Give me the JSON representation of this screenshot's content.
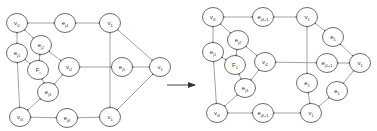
{
  "diagram": {
    "colors": {
      "stroke": "#5a5a5a",
      "edge": "#8a8a8a",
      "text": "#333333",
      "background": "#ffffff"
    },
    "arrow": {
      "x1": 167,
      "y1": 85,
      "x2": 195,
      "y2": 85
    },
    "left": {
      "nodes": [
        {
          "id": "L_vi1",
          "label": "v",
          "sub": "i1",
          "x": 17,
          "y": 23
        },
        {
          "id": "L_ej4",
          "label": "e",
          "sub": "j4",
          "x": 65,
          "y": 23
        },
        {
          "id": "L_v1_top",
          "label": "v",
          "sub": "1",
          "x": 110,
          "y": 23
        },
        {
          "id": "L_ej2",
          "label": "e",
          "sub": "j2",
          "x": 41,
          "y": 45
        },
        {
          "id": "L_ej1",
          "label": "e",
          "sub": "j1",
          "x": 17,
          "y": 53
        },
        {
          "id": "L_Fi",
          "label": "F",
          "sub": "i",
          "x": 38,
          "y": 70
        },
        {
          "id": "L_vi2",
          "label": "v",
          "sub": "i2",
          "x": 69,
          "y": 67
        },
        {
          "id": "L_ej5",
          "label": "e",
          "sub": "j5",
          "x": 122,
          "y": 67
        },
        {
          "id": "L_v1_right",
          "label": "v",
          "sub": "1",
          "x": 160,
          "y": 67
        },
        {
          "id": "L_ej3",
          "label": "e",
          "sub": "j3",
          "x": 48,
          "y": 92
        },
        {
          "id": "L_vi3",
          "label": "v",
          "sub": "i3",
          "x": 20,
          "y": 117
        },
        {
          "id": "L_ej6",
          "label": "e",
          "sub": "j6",
          "x": 67,
          "y": 118
        },
        {
          "id": "L_v1_bottom",
          "label": "v",
          "sub": "1",
          "x": 110,
          "y": 117
        }
      ],
      "edges": [
        [
          "L_vi1",
          "L_ej4"
        ],
        [
          "L_ej4",
          "L_v1_top"
        ],
        [
          "L_vi1",
          "L_ej1"
        ],
        [
          "L_vi1",
          "L_ej2"
        ],
        [
          "L_ej1",
          "L_Fi"
        ],
        [
          "L_ej2",
          "L_Fi"
        ],
        [
          "L_ej2",
          "L_vi2"
        ],
        [
          "L_Fi",
          "L_ej3"
        ],
        [
          "L_vi2",
          "L_ej3"
        ],
        [
          "L_vi2",
          "L_ej5"
        ],
        [
          "L_ej5",
          "L_v1_right"
        ],
        [
          "L_ej1",
          "L_vi3"
        ],
        [
          "L_ej3",
          "L_vi3"
        ],
        [
          "L_vi3",
          "L_ej6"
        ],
        [
          "L_ej6",
          "L_v1_bottom"
        ],
        [
          "L_v1_top",
          "L_v1_bottom"
        ],
        [
          "L_v1_top",
          "L_v1_right"
        ],
        [
          "L_v1_right",
          "L_v1_bottom"
        ]
      ]
    },
    "right": {
      "nodes": [
        {
          "id": "R_vi1",
          "label": "v",
          "sub": "i1",
          "x": 213,
          "y": 17
        },
        {
          "id": "R_ej4",
          "label": "e",
          "sub": "j4+1",
          "x": 263,
          "y": 17
        },
        {
          "id": "R_v1_top",
          "label": "v",
          "sub": "1",
          "x": 307,
          "y": 17
        },
        {
          "id": "R_e1_tr",
          "label": "e",
          "sub": "1",
          "x": 333,
          "y": 37
        },
        {
          "id": "R_ej2",
          "label": "e",
          "sub": "j2",
          "x": 238,
          "y": 40
        },
        {
          "id": "R_ej1",
          "label": "e",
          "sub": "j1",
          "x": 213,
          "y": 52
        },
        {
          "id": "R_F1",
          "label": "F",
          "sub": "1",
          "x": 235,
          "y": 65
        },
        {
          "id": "R_vi2",
          "label": "v",
          "sub": "i2",
          "x": 265,
          "y": 62
        },
        {
          "id": "R_ej5",
          "label": "e",
          "sub": "j5+1",
          "x": 327,
          "y": 63
        },
        {
          "id": "R_v1_right",
          "label": "v",
          "sub": "1",
          "x": 360,
          "y": 63
        },
        {
          "id": "R_e1_mid",
          "label": "e",
          "sub": "1",
          "x": 307,
          "y": 83
        },
        {
          "id": "R_e1_br",
          "label": "e",
          "sub": "1",
          "x": 337,
          "y": 91
        },
        {
          "id": "R_ej3",
          "label": "e",
          "sub": "j3",
          "x": 245,
          "y": 88
        },
        {
          "id": "R_vi3",
          "label": "v",
          "sub": "i3",
          "x": 217,
          "y": 113
        },
        {
          "id": "R_ej6",
          "label": "e",
          "sub": "j6+1",
          "x": 263,
          "y": 113
        },
        {
          "id": "R_v1_bottom",
          "label": "v",
          "sub": "1",
          "x": 311,
          "y": 113
        }
      ],
      "edges": [
        [
          "R_vi1",
          "R_ej4"
        ],
        [
          "R_ej4",
          "R_v1_top"
        ],
        [
          "R_vi1",
          "R_ej1"
        ],
        [
          "R_vi1",
          "R_ej2"
        ],
        [
          "R_ej1",
          "R_F1"
        ],
        [
          "R_ej2",
          "R_F1"
        ],
        [
          "R_ej2",
          "R_vi2"
        ],
        [
          "R_F1",
          "R_ej3"
        ],
        [
          "R_vi2",
          "R_ej3"
        ],
        [
          "R_vi2",
          "R_ej5"
        ],
        [
          "R_ej5",
          "R_v1_right"
        ],
        [
          "R_ej1",
          "R_vi3"
        ],
        [
          "R_ej3",
          "R_vi3"
        ],
        [
          "R_vi3",
          "R_ej6"
        ],
        [
          "R_ej6",
          "R_v1_bottom"
        ],
        [
          "R_v1_top",
          "R_e1_mid"
        ],
        [
          "R_e1_mid",
          "R_v1_bottom"
        ],
        [
          "R_v1_top",
          "R_e1_tr"
        ],
        [
          "R_e1_tr",
          "R_v1_right"
        ],
        [
          "R_v1_right",
          "R_e1_br"
        ],
        [
          "R_e1_br",
          "R_v1_bottom"
        ]
      ]
    }
  }
}
